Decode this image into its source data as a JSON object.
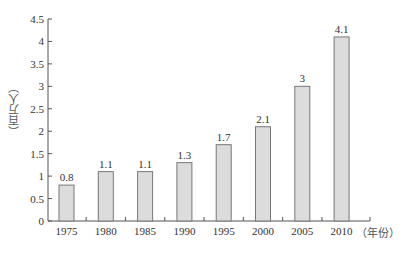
{
  "chart_data": {
    "type": "bar",
    "title": "",
    "xlabel": "（年份）",
    "ylabel": "（百万人）",
    "categories": [
      "1975",
      "1980",
      "1985",
      "1990",
      "1995",
      "2000",
      "2005",
      "2010"
    ],
    "values": [
      0.8,
      1.1,
      1.1,
      1.3,
      1.7,
      2.1,
      3,
      4.1
    ],
    "data_labels": [
      "0.8",
      "1.1",
      "1.1",
      "1.3",
      "1.7",
      "2.1",
      "3",
      "4.1"
    ],
    "ylim": [
      0,
      4.5
    ],
    "yticks": [
      0,
      0.5,
      1,
      1.5,
      2,
      2.5,
      3,
      3.5,
      4,
      4.5
    ],
    "ytick_labels": [
      "0",
      "0.5",
      "1",
      "1.5",
      "2",
      "2.5",
      "3",
      "3.5",
      "4",
      "4.5"
    ],
    "grid": false,
    "legend": null,
    "colors": {
      "bar_fill": "#dcdcdc",
      "bar_stroke": "#777777",
      "axis": "#555555",
      "text": "#333333"
    }
  }
}
